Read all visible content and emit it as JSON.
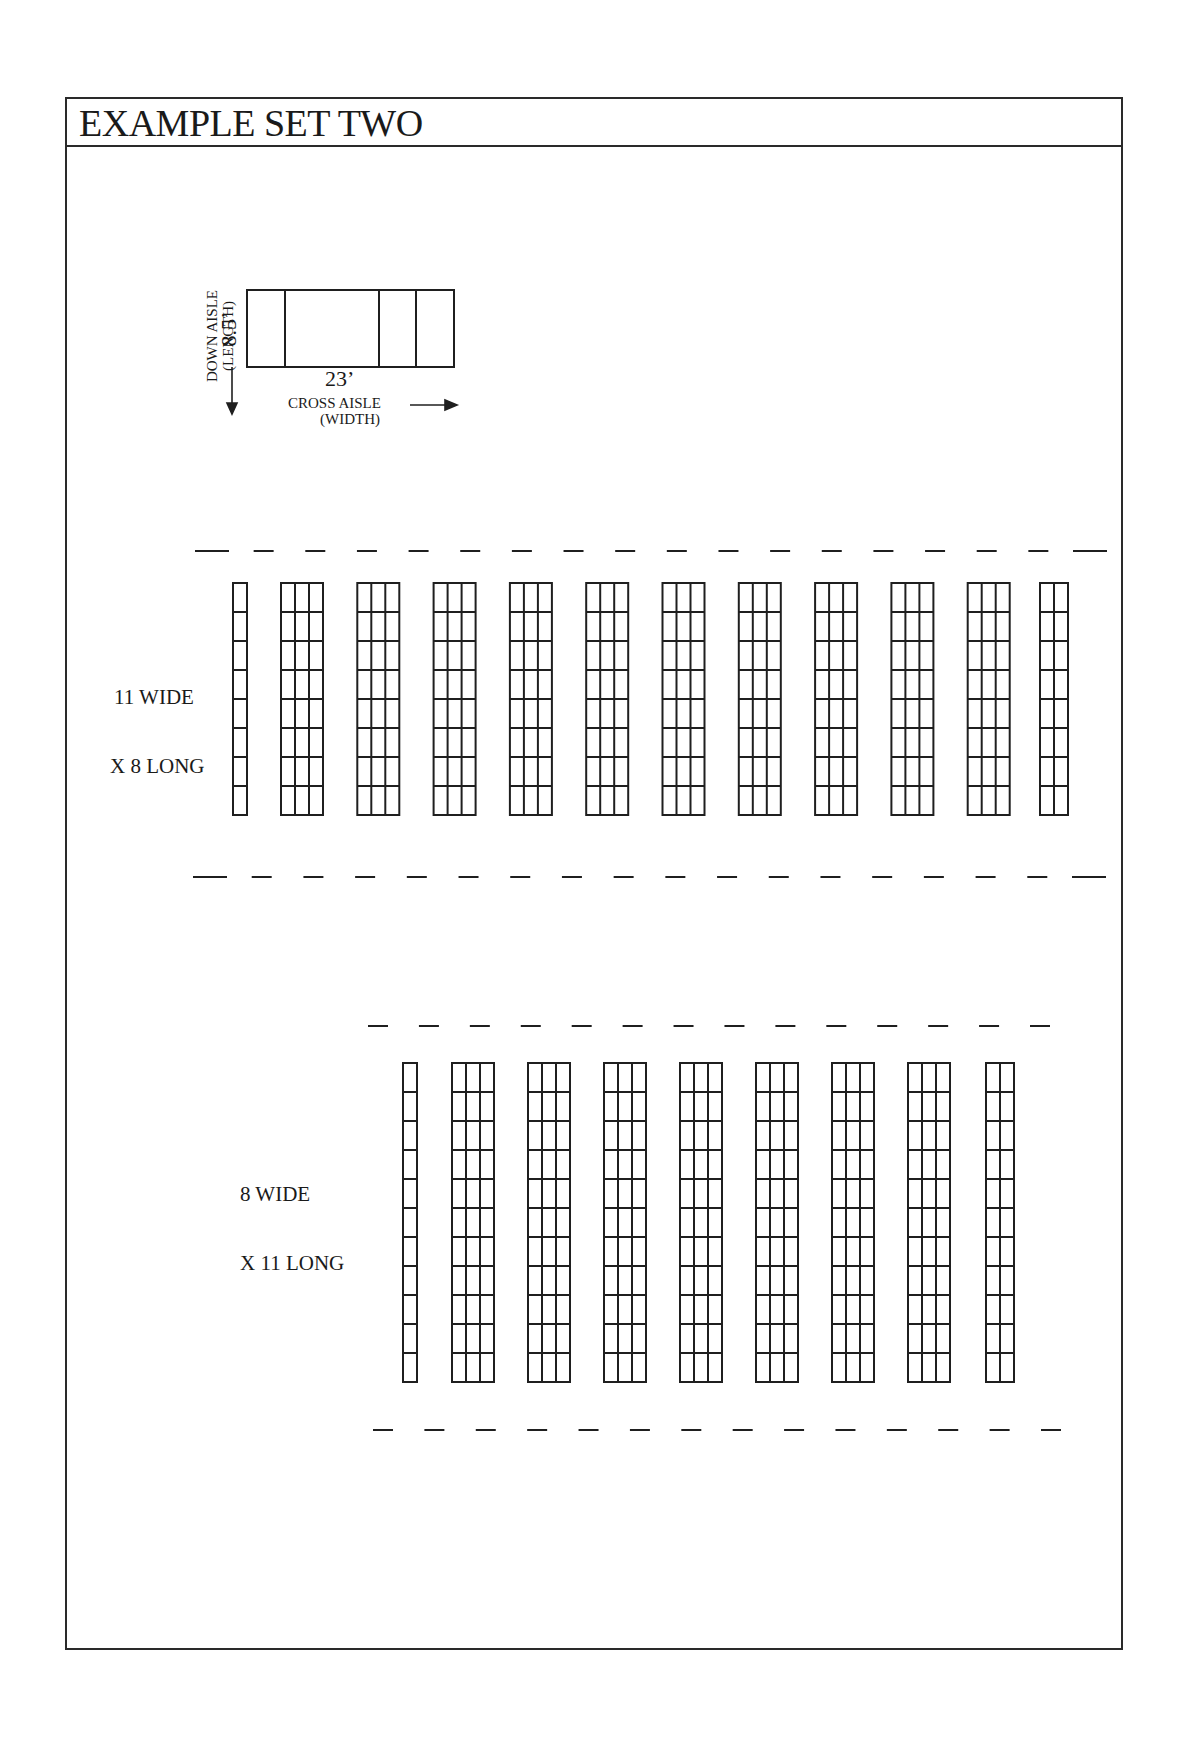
{
  "header": {
    "title": "EXAMPLE SET TWO"
  },
  "legend": {
    "length_value": "8.5’",
    "width_value": "23’",
    "down_aisle_label": "DOWN AISLE",
    "down_aisle_sub": "(LENGTH)",
    "cross_aisle_label": "CROSS AISLE",
    "cross_aisle_sub": "(WIDTH)",
    "icons": [
      "arrow-down-icon",
      "arrow-right-icon"
    ]
  },
  "layouts": [
    {
      "label_line1": "11 WIDE",
      "label_line2": "X 8 LONG",
      "rows": 8,
      "columns": [
        1,
        3,
        3,
        3,
        3,
        3,
        3,
        3,
        3,
        3,
        3,
        2
      ],
      "top_dashes": 18,
      "bottom_dashes": 18
    },
    {
      "label_line1": "8 WIDE",
      "label_line2": "X 11 LONG",
      "rows": 11,
      "columns": [
        1,
        3,
        3,
        3,
        3,
        3,
        3,
        3,
        2
      ],
      "top_dashes": 14,
      "bottom_dashes": 14
    }
  ],
  "colors": {
    "line": "#1f1f1f",
    "background": "#ffffff"
  }
}
